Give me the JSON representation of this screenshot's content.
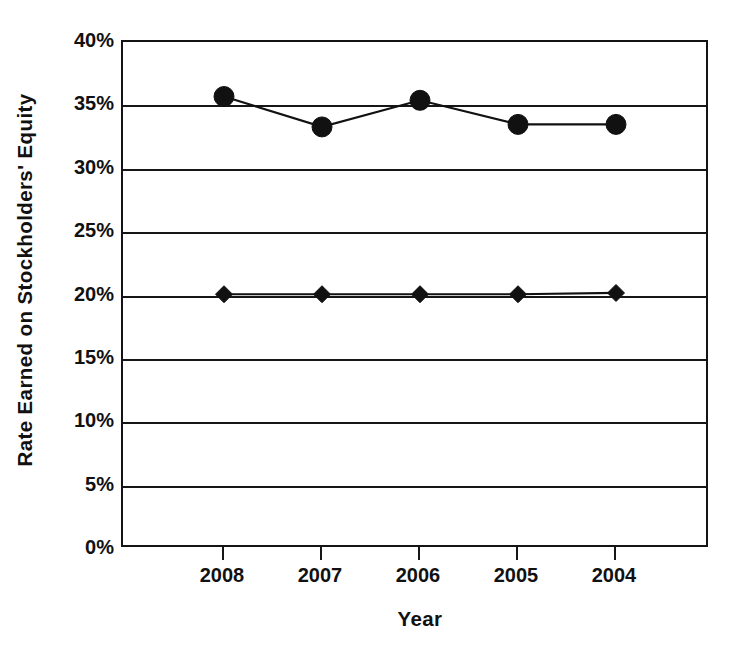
{
  "chart_data": {
    "type": "line",
    "title": "",
    "xlabel": "Year",
    "ylabel": "Rate Earned on Stockholders' Equity",
    "categories": [
      "2008",
      "2007",
      "2006",
      "2005",
      "2004"
    ],
    "x_tick_labels": [
      "2008",
      "2007",
      "2006",
      "2005",
      "2004"
    ],
    "y_tick_labels": [
      "40%",
      "35%",
      "30%",
      "25%",
      "20%",
      "15%",
      "10%",
      "5%",
      "0%"
    ],
    "y_tick_values": [
      40,
      35,
      30,
      25,
      20,
      15,
      10,
      5,
      0
    ],
    "ylim": [
      0,
      40
    ],
    "ylim_label_suffix": "%",
    "grid": true,
    "grid_axis": "y",
    "legend": "none",
    "series": [
      {
        "name": "series-circle",
        "marker": "circle",
        "color": "#111111",
        "values": [
          35.7,
          33.3,
          35.4,
          33.5,
          33.5
        ]
      },
      {
        "name": "series-diamond",
        "marker": "diamond",
        "color": "#111111",
        "values": [
          20.1,
          20.1,
          20.1,
          20.1,
          20.2
        ]
      }
    ]
  },
  "axes": {
    "y_title": "Rate Earned on Stockholders' Equity",
    "x_title": "Year"
  },
  "ticks": {
    "y": [
      {
        "label": "40%",
        "value": 40
      },
      {
        "label": "35%",
        "value": 35
      },
      {
        "label": "30%",
        "value": 30
      },
      {
        "label": "25%",
        "value": 25
      },
      {
        "label": "20%",
        "value": 20
      },
      {
        "label": "15%",
        "value": 15
      },
      {
        "label": "10%",
        "value": 10
      },
      {
        "label": "5%",
        "value": 5
      },
      {
        "label": "0%",
        "value": 0
      }
    ],
    "x": [
      {
        "label": "2008"
      },
      {
        "label": "2007"
      },
      {
        "label": "2006"
      },
      {
        "label": "2005"
      },
      {
        "label": "2004"
      }
    ]
  },
  "style": {
    "line_color": "#111111",
    "axis_color": "#161616",
    "background": "#ffffff"
  }
}
